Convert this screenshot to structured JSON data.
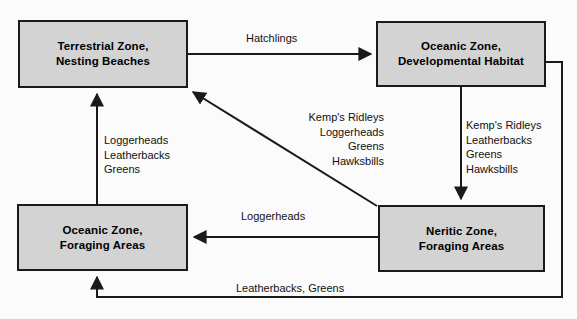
{
  "diagram": {
    "box_fill": "#d3d3d3",
    "line_color": "#1a1a1a",
    "nodes": [
      {
        "id": "terrestrial",
        "line1": "Terrestrial Zone,",
        "line2": "Nesting Beaches"
      },
      {
        "id": "oceanic-developmental",
        "line1": "Oceanic Zone,",
        "line2": "Developmental Habitat"
      },
      {
        "id": "oceanic-foraging",
        "line1": "Oceanic Zone,",
        "line2": "Foraging Areas"
      },
      {
        "id": "neritic-foraging",
        "line1": "Neritic Zone,",
        "line2": "Foraging Areas"
      }
    ],
    "edge_labels": {
      "hatchlings": "Hatchlings",
      "left_stack": [
        "Loggerheads",
        "Leatherbacks",
        "Greens"
      ],
      "center_stack": [
        "Kemp's Ridleys",
        "Loggerheads",
        "Greens",
        "Hawksbills"
      ],
      "right_stack": [
        "Kemp's Ridleys",
        "Leatherbacks",
        "Greens",
        "Hawksbills"
      ],
      "loggerheads": "Loggerheads",
      "leatherbacks_greens": "Leatherbacks, Greens"
    }
  }
}
